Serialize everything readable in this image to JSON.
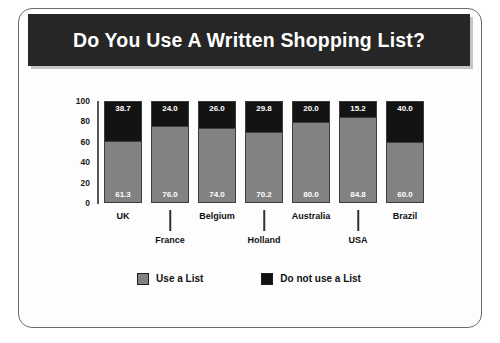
{
  "header": {
    "title": "Do You Use A Written Shopping List?"
  },
  "colors": {
    "banner_background": "#262626",
    "banner_text": "#ffffff",
    "use_a_list": "#828282",
    "do_not_use_a_list": "#131313",
    "card_background": "#fdfdfd",
    "frame_border": "#6b6b6b"
  },
  "chart_data": {
    "type": "bar",
    "subtype": "stacked-percentage",
    "title": "Do You Use A Written Shopping List?",
    "xlabel": "",
    "ylabel": "",
    "ylim": [
      0,
      100
    ],
    "yticks": [
      "0",
      "20",
      "40",
      "60",
      "80",
      "100"
    ],
    "grid": false,
    "legend_position": "bottom-center",
    "categories": [
      "UK",
      "France",
      "Belgium",
      "Holland",
      "Australia",
      "USA",
      "Brazil"
    ],
    "series": [
      {
        "name": "Use a List",
        "color": "#828282",
        "values": [
          61.3,
          76.0,
          74.0,
          70.2,
          80.0,
          84.8,
          60.0
        ],
        "labels": [
          "61.3",
          "76.0",
          "74.0",
          "70.2",
          "80.0",
          "84.8",
          "60.0"
        ]
      },
      {
        "name": "Do not use a List",
        "color": "#131313",
        "values": [
          38.7,
          24.0,
          26.0,
          29.8,
          20.0,
          15.2,
          40.0
        ],
        "labels": [
          "38.7",
          "24.0",
          "26.0",
          "29.8",
          "20.0",
          "15.2",
          "40.0"
        ]
      }
    ],
    "category_label_rows": [
      "top",
      "bottom",
      "top",
      "bottom",
      "top",
      "bottom",
      "top"
    ]
  },
  "legend": {
    "items": [
      {
        "label": "Use a List",
        "swatch": "light"
      },
      {
        "label": "Do not use a List",
        "swatch": "dark"
      }
    ]
  }
}
